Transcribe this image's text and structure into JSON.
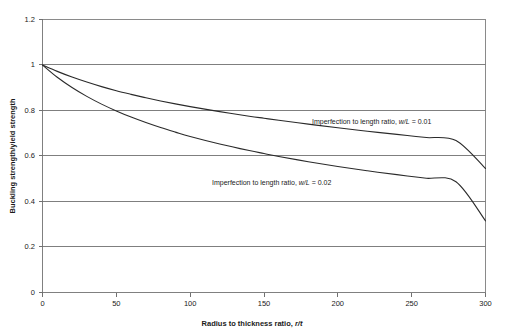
{
  "top_bleed_text": "",
  "chart_data": {
    "type": "line",
    "title": "",
    "xlabel_full": "Radius to thickness ratio, r/t",
    "xlabel_prefix": "Radius to thickness ratio, ",
    "xlabel_symbol": "r/t",
    "ylabel": "Buckling strength/yield strength",
    "xlim": [
      0,
      300
    ],
    "ylim": [
      0,
      1.2
    ],
    "xticks": [
      0,
      50,
      100,
      150,
      200,
      250,
      300
    ],
    "xtick_labels": [
      "0",
      "50",
      "100",
      "150",
      "200",
      "250",
      "300"
    ],
    "yticks": [
      0,
      0.2,
      0.4,
      0.6,
      0.8,
      1,
      1.2
    ],
    "ytick_labels": [
      "0",
      "0.2",
      "0.4",
      "0.6",
      "0.8",
      "1",
      "1.2"
    ],
    "grid": "horizontal",
    "legend_position": "inline-annotation",
    "x": [
      0,
      10,
      20,
      30,
      40,
      50,
      60,
      70,
      80,
      90,
      100,
      120,
      140,
      150,
      160,
      180,
      200,
      220,
      240,
      250,
      260,
      280,
      300
    ],
    "series": [
      {
        "name": "Imperfection to length ratio, w/L = 0.01",
        "label_prefix": "Imperfection to length ratio, ",
        "label_symbol": "w/L",
        "label_suffix": " = 0.01",
        "color": "#2a2a2a",
        "values": [
          1.0,
          0.972,
          0.947,
          0.925,
          0.905,
          0.887,
          0.871,
          0.856,
          0.842,
          0.829,
          0.817,
          0.795,
          0.775,
          0.766,
          0.757,
          0.74,
          0.724,
          0.709,
          0.695,
          0.688,
          0.681,
          0.668,
          0.545
        ]
      },
      {
        "name": "Imperfection to length ratio, w/L = 0.02",
        "label_prefix": "Imperfection to length ratio, ",
        "label_symbol": "w/L",
        "label_suffix": " = 0.02",
        "color": "#2a2a2a",
        "values": [
          1.0,
          0.946,
          0.901,
          0.862,
          0.828,
          0.798,
          0.771,
          0.747,
          0.725,
          0.705,
          0.686,
          0.653,
          0.624,
          0.611,
          0.598,
          0.575,
          0.554,
          0.535,
          0.518,
          0.51,
          0.502,
          0.487,
          0.315
        ]
      }
    ],
    "annotations": [
      {
        "id": "label-wl-001",
        "text": "Imperfection to length ratio, w/L = 0.01",
        "x_px": 312,
        "y_px": 124
      },
      {
        "id": "label-wl-002",
        "text": "Imperfection to length ratio, w/L = 0.02",
        "x_px": 212,
        "y_px": 185
      }
    ]
  }
}
